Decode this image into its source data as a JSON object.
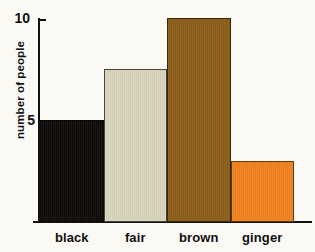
{
  "chart_data": {
    "type": "bar",
    "title": "",
    "xlabel": "",
    "ylabel": "number of people",
    "categories": [
      "black",
      "fair",
      "brown",
      "ginger"
    ],
    "values": [
      5,
      7.5,
      10,
      3
    ],
    "ylim": [
      0,
      10
    ],
    "yticks": [
      5,
      10
    ],
    "ytick_labels": [
      "5",
      "10"
    ],
    "grid": false,
    "legend": "none",
    "bar_colors": [
      "#0D0A08",
      "#D9D4BD",
      "#8B5E18",
      "#F2821F"
    ],
    "background": "#FBF9F4",
    "axis_color": "#111111"
  },
  "axes": {
    "y_label": "number of people",
    "tick_10": "10",
    "tick_5": "5"
  },
  "bars": [
    {
      "category": "black",
      "value": 5,
      "color": "#0D0A08",
      "name": "bar-black"
    },
    {
      "category": "fair",
      "value": 7.5,
      "color": "#D9D4BD",
      "name": "bar-fair"
    },
    {
      "category": "brown",
      "value": 10,
      "color": "#8B5E18",
      "name": "bar-brown"
    },
    {
      "category": "ginger",
      "value": 3,
      "color": "#F2821F",
      "name": "bar-ginger"
    }
  ]
}
